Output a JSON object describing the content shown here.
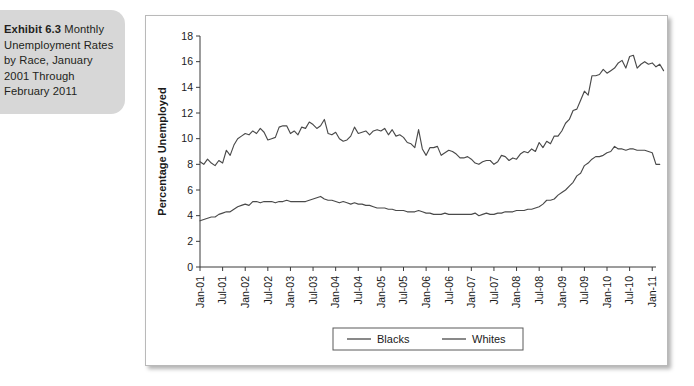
{
  "caption": {
    "lead": "Exhibit 6.3",
    "text": " Monthly Unemployment Rates by Race, January 2001 Through February 2011"
  },
  "colors": {
    "caption_background": "#d7d7d7",
    "line": "#4a4a4a",
    "axis": "#3b3b3b",
    "frame_border": "#b9b9b9",
    "text": "#1a1a1a"
  },
  "chart_data": {
    "type": "line",
    "title": "",
    "xlabel": "",
    "ylabel": "Percentage Unemployed",
    "ylim": [
      0,
      18
    ],
    "yticks": [
      0,
      2,
      4,
      6,
      8,
      10,
      12,
      14,
      16,
      18
    ],
    "grid": false,
    "legend_position": "bottom-center",
    "xtick_labels": [
      "Jan-01",
      "Jul-01",
      "Jan-02",
      "Jul-02",
      "Jan-03",
      "Jul-03",
      "Jan-04",
      "Jul-04",
      "Jan-05",
      "Jul-05",
      "Jan-06",
      "Jul-06",
      "Jan-07",
      "Jul-07",
      "Jan-08",
      "Jul-08",
      "Jan-09",
      "Jul-09",
      "Jan-10",
      "Jul-10",
      "Jan-11"
    ],
    "x_start_label": "Jan-01",
    "x_end_label": "Feb-11",
    "n_points": 122,
    "series": [
      {
        "name": "Blacks",
        "values": [
          8.2,
          8.0,
          8.4,
          8.1,
          7.9,
          8.3,
          8.1,
          9.1,
          8.7,
          9.5,
          10.0,
          10.2,
          10.4,
          10.3,
          10.6,
          10.4,
          10.8,
          10.5,
          9.9,
          10.0,
          10.1,
          10.9,
          11.0,
          11.0,
          10.4,
          10.6,
          10.3,
          10.9,
          10.8,
          11.3,
          11.1,
          10.8,
          11.0,
          11.5,
          10.4,
          10.3,
          10.5,
          10.0,
          9.8,
          9.9,
          10.2,
          10.9,
          10.4,
          10.5,
          10.6,
          10.3,
          10.6,
          10.7,
          10.6,
          10.8,
          10.3,
          10.7,
          10.2,
          10.3,
          10.1,
          9.7,
          9.6,
          9.3,
          10.7,
          9.2,
          8.7,
          9.3,
          9.3,
          9.4,
          8.7,
          8.9,
          9.1,
          9.0,
          8.8,
          8.5,
          8.5,
          8.6,
          8.4,
          8.1,
          8.0,
          8.2,
          8.3,
          8.3,
          8.0,
          8.2,
          8.7,
          8.6,
          8.3,
          8.5,
          8.4,
          8.8,
          9.0,
          8.9,
          9.2,
          9.0,
          9.7,
          9.3,
          9.8,
          9.6,
          10.2,
          10.2,
          10.6,
          11.2,
          11.5,
          12.2,
          12.3,
          13.0,
          13.7,
          13.4,
          14.9,
          14.9,
          15.0,
          15.4,
          15.1,
          15.3,
          15.5,
          15.9,
          16.1,
          15.5,
          16.4,
          16.5,
          15.5,
          15.8,
          16.0,
          15.8,
          15.9,
          15.6,
          15.8,
          15.3
        ]
      },
      {
        "name": "Whites",
        "values": [
          3.6,
          3.7,
          3.8,
          3.9,
          3.9,
          4.1,
          4.2,
          4.3,
          4.3,
          4.5,
          4.7,
          4.8,
          4.9,
          4.8,
          5.1,
          5.1,
          5.0,
          5.1,
          5.1,
          5.1,
          5.0,
          5.1,
          5.1,
          5.2,
          5.1,
          5.1,
          5.1,
          5.1,
          5.1,
          5.2,
          5.3,
          5.4,
          5.5,
          5.3,
          5.2,
          5.2,
          5.1,
          5.0,
          5.1,
          5.0,
          4.9,
          5.0,
          4.9,
          4.9,
          4.8,
          4.8,
          4.7,
          4.6,
          4.6,
          4.6,
          4.5,
          4.5,
          4.4,
          4.4,
          4.4,
          4.3,
          4.3,
          4.3,
          4.4,
          4.3,
          4.2,
          4.2,
          4.1,
          4.1,
          4.1,
          4.2,
          4.1,
          4.1,
          4.1,
          4.1,
          4.1,
          4.1,
          4.1,
          4.2,
          4.0,
          4.1,
          4.2,
          4.1,
          4.1,
          4.2,
          4.2,
          4.3,
          4.3,
          4.3,
          4.4,
          4.4,
          4.4,
          4.5,
          4.5,
          4.6,
          4.7,
          4.9,
          5.2,
          5.2,
          5.3,
          5.6,
          5.8,
          6.0,
          6.3,
          6.6,
          7.1,
          7.3,
          7.9,
          8.1,
          8.4,
          8.6,
          8.6,
          8.7,
          8.9,
          9.0,
          9.4,
          9.2,
          9.2,
          9.1,
          9.2,
          9.2,
          9.1,
          9.1,
          9.1,
          9.0,
          8.9,
          8.0,
          8.0
        ]
      }
    ]
  },
  "legend": {
    "entries": [
      {
        "label": "Blacks"
      },
      {
        "label": "Whites"
      }
    ]
  }
}
